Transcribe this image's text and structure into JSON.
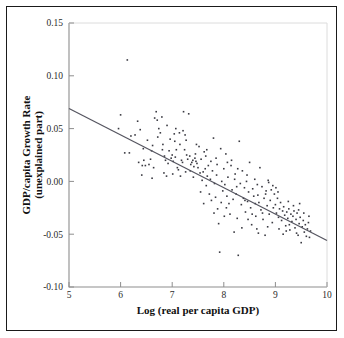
{
  "figure": {
    "border_color": "#1a1a1a",
    "background": "#ffffff"
  },
  "chart_data": {
    "type": "scatter",
    "title": "",
    "subtitle": "",
    "xlabel": "Log (real per capita GDP)",
    "ylabel": "GDP/capita Growth Rate (unexplained part)",
    "ylabel_line1": "GDP/capita Growth Rate",
    "ylabel_line2": "(unexplained part)",
    "xlim": [
      5,
      10
    ],
    "ylim": [
      -0.1,
      0.15
    ],
    "xticks": [
      5,
      6,
      7,
      8,
      9,
      10
    ],
    "xtick_labels": [
      "5",
      "6",
      "7",
      "8",
      "9",
      "10"
    ],
    "yticks": [
      -0.1,
      -0.05,
      0.0,
      0.05,
      0.1,
      0.15
    ],
    "ytick_labels": [
      "-0.10",
      "-0.05",
      "0.00",
      "0.05",
      "0.10",
      "0.15"
    ],
    "grid": false,
    "legend": null,
    "point_color": "#3a3a42",
    "point_size": 1.6,
    "marker": "square",
    "series": [
      {
        "name": "countries",
        "points": [
          [
            6.13,
            0.115
          ],
          [
            6.0,
            0.063
          ],
          [
            6.08,
            0.027
          ],
          [
            6.17,
            0.027
          ],
          [
            5.96,
            0.05
          ],
          [
            6.28,
            0.044
          ],
          [
            6.33,
            0.057
          ],
          [
            6.38,
            0.049
          ],
          [
            6.42,
            0.015
          ],
          [
            6.45,
            0.02
          ],
          [
            6.48,
            0.015
          ],
          [
            6.52,
            0.039
          ],
          [
            6.55,
            0.016
          ],
          [
            6.58,
            0.021
          ],
          [
            6.62,
            0.034
          ],
          [
            6.66,
            0.06
          ],
          [
            6.69,
            0.066
          ],
          [
            6.71,
            0.058
          ],
          [
            6.74,
            0.05
          ],
          [
            6.77,
            0.046
          ],
          [
            6.8,
            0.061
          ],
          [
            6.82,
            0.035
          ],
          [
            6.85,
            0.024
          ],
          [
            6.87,
            0.02
          ],
          [
            6.89,
            0.005
          ],
          [
            6.92,
            0.017
          ],
          [
            6.94,
            0.029
          ],
          [
            6.96,
            0.04
          ],
          [
            6.98,
            0.022
          ],
          [
            7.0,
            0.025
          ],
          [
            7.02,
            0.019
          ],
          [
            7.04,
            0.045
          ],
          [
            7.06,
            0.023
          ],
          [
            7.08,
            0.03
          ],
          [
            7.1,
            0.013
          ],
          [
            7.12,
            0.011
          ],
          [
            7.14,
            0.046
          ],
          [
            7.16,
            0.005
          ],
          [
            7.18,
            0.02
          ],
          [
            7.2,
            0.018
          ],
          [
            7.22,
            0.066
          ],
          [
            7.24,
            0.03
          ],
          [
            7.26,
            0.009
          ],
          [
            7.28,
            0.025
          ],
          [
            7.3,
            0.021
          ],
          [
            7.32,
            0.064
          ],
          [
            7.34,
            0.024
          ],
          [
            7.36,
            0.016
          ],
          [
            7.38,
            0.018
          ],
          [
            7.4,
            0.02
          ],
          [
            7.42,
            0.014
          ],
          [
            7.44,
            0.022
          ],
          [
            7.46,
            0.019
          ],
          [
            7.48,
            0.017
          ],
          [
            7.5,
            0.013
          ],
          [
            7.52,
            0.033
          ],
          [
            7.54,
            0.008
          ],
          [
            7.56,
            0.021
          ],
          [
            7.58,
            0.001
          ],
          [
            7.6,
            0.009
          ],
          [
            7.62,
            0.028
          ],
          [
            7.64,
            0.012
          ],
          [
            7.66,
            -0.004
          ],
          [
            7.68,
            0.005
          ],
          [
            7.7,
            0.015
          ],
          [
            7.72,
            -0.012
          ],
          [
            7.74,
            0.002
          ],
          [
            7.76,
            -0.018
          ],
          [
            7.78,
            0.01
          ],
          [
            7.8,
            0.041
          ],
          [
            7.82,
            -0.002
          ],
          [
            7.84,
            -0.015
          ],
          [
            7.86,
            0.006
          ],
          [
            7.88,
            -0.026
          ],
          [
            7.9,
            -0.04
          ],
          [
            7.92,
            -0.067
          ],
          [
            7.94,
            0.031
          ],
          [
            7.96,
            0.0
          ],
          [
            7.98,
            -0.009
          ],
          [
            8.0,
            0.012
          ],
          [
            8.02,
            -0.003
          ],
          [
            8.04,
            0.026
          ],
          [
            8.06,
            -0.014
          ],
          [
            8.08,
            0.004
          ],
          [
            8.1,
            -0.021
          ],
          [
            8.12,
            -0.031
          ],
          [
            8.14,
            0.015
          ],
          [
            8.16,
            -0.008
          ],
          [
            8.18,
            -0.017
          ],
          [
            8.2,
            -0.048
          ],
          [
            8.22,
            0.007
          ],
          [
            8.24,
            -0.012
          ],
          [
            8.26,
            -0.035
          ],
          [
            8.28,
            -0.07
          ],
          [
            8.3,
            0.038
          ],
          [
            8.32,
            -0.002
          ],
          [
            8.34,
            -0.022
          ],
          [
            8.36,
            0.01
          ],
          [
            8.38,
            -0.016
          ],
          [
            8.4,
            -0.006
          ],
          [
            8.42,
            -0.029
          ],
          [
            8.44,
            0.0
          ],
          [
            8.46,
            -0.019
          ],
          [
            8.48,
            -0.01
          ],
          [
            8.5,
            0.018
          ],
          [
            8.52,
            -0.025
          ],
          [
            8.54,
            -0.041
          ],
          [
            8.56,
            -0.007
          ],
          [
            8.58,
            -0.014
          ],
          [
            8.6,
            0.002
          ],
          [
            8.62,
            -0.033
          ],
          [
            8.64,
            -0.045
          ],
          [
            8.66,
            -0.013
          ],
          [
            8.68,
            -0.02
          ],
          [
            8.7,
            0.013
          ],
          [
            8.72,
            -0.027
          ],
          [
            8.74,
            -0.005
          ],
          [
            8.76,
            -0.036
          ],
          [
            8.78,
            -0.016
          ],
          [
            8.8,
            -0.051
          ],
          [
            8.82,
            -0.009
          ],
          [
            8.84,
            -0.023
          ],
          [
            8.86,
            0.001
          ],
          [
            8.88,
            -0.031
          ],
          [
            8.9,
            -0.018
          ],
          [
            8.92,
            -0.008
          ],
          [
            8.94,
            -0.039
          ],
          [
            8.96,
            -0.025
          ],
          [
            8.98,
            -0.012
          ],
          [
            9.0,
            -0.022
          ],
          [
            9.02,
            -0.03
          ],
          [
            9.04,
            -0.016
          ],
          [
            9.06,
            -0.034
          ],
          [
            9.08,
            -0.026
          ],
          [
            9.1,
            -0.02
          ],
          [
            9.12,
            -0.037
          ],
          [
            9.14,
            -0.028
          ],
          [
            9.16,
            -0.024
          ],
          [
            9.18,
            -0.032
          ],
          [
            9.2,
            -0.042
          ],
          [
            9.22,
            -0.029
          ],
          [
            9.24,
            -0.035
          ],
          [
            9.26,
            -0.026
          ],
          [
            9.28,
            -0.046
          ],
          [
            9.3,
            -0.031
          ],
          [
            9.32,
            -0.038
          ],
          [
            9.34,
            -0.033
          ],
          [
            9.36,
            -0.028
          ],
          [
            9.38,
            -0.044
          ],
          [
            9.4,
            -0.036
          ],
          [
            9.42,
            -0.03
          ],
          [
            9.44,
            -0.051
          ],
          [
            9.46,
            -0.04
          ],
          [
            9.48,
            -0.034
          ],
          [
            9.5,
            -0.058
          ],
          [
            9.52,
            -0.043
          ],
          [
            9.54,
            -0.037
          ],
          [
            9.56,
            -0.048
          ],
          [
            9.58,
            -0.041
          ],
          [
            9.6,
            -0.052
          ],
          [
            9.62,
            -0.045
          ],
          [
            9.64,
            -0.039
          ],
          [
            9.66,
            -0.053
          ],
          [
            9.68,
            -0.047
          ],
          [
            6.2,
            0.043
          ],
          [
            6.35,
            0.018
          ],
          [
            6.6,
            0.029
          ],
          [
            6.72,
            0.042
          ],
          [
            6.9,
            0.053
          ],
          [
            7.05,
            0.038
          ],
          [
            7.15,
            0.035
          ],
          [
            7.25,
            0.044
          ],
          [
            7.35,
            0.01
          ],
          [
            7.45,
            0.026
          ],
          [
            7.55,
            -0.01
          ],
          [
            7.65,
            0.024
          ],
          [
            7.75,
            0.019
          ],
          [
            7.85,
            0.022
          ],
          [
            7.95,
            -0.02
          ],
          [
            8.05,
            -0.025
          ],
          [
            8.15,
            0.02
          ],
          [
            8.25,
            -0.005
          ],
          [
            8.35,
            -0.044
          ],
          [
            8.45,
            0.006
          ],
          [
            8.55,
            -0.031
          ],
          [
            8.65,
            -0.003
          ],
          [
            8.75,
            -0.03
          ],
          [
            8.85,
            -0.043
          ],
          [
            8.95,
            -0.004
          ],
          [
            9.05,
            -0.01
          ],
          [
            9.15,
            -0.05
          ],
          [
            9.25,
            -0.019
          ],
          [
            9.35,
            -0.023
          ],
          [
            9.45,
            -0.027
          ],
          [
            9.55,
            -0.03
          ],
          [
            9.65,
            -0.033
          ],
          [
            6.44,
            0.031
          ],
          [
            6.64,
            0.013
          ],
          [
            6.84,
            0.008
          ],
          [
            7.07,
            0.05
          ],
          [
            7.27,
            0.039
          ],
          [
            7.47,
            0.035
          ],
          [
            7.67,
            0.03
          ],
          [
            7.87,
            0.016
          ],
          [
            8.07,
            0.018
          ],
          [
            8.27,
            0.012
          ],
          [
            8.47,
            -0.036
          ],
          [
            8.67,
            -0.049
          ],
          [
            8.87,
            -0.001
          ],
          [
            9.07,
            -0.045
          ],
          [
            9.27,
            -0.041
          ],
          [
            9.47,
            -0.021
          ],
          [
            6.41,
            0.006
          ],
          [
            6.61,
            0.003
          ],
          [
            6.81,
            0.03
          ],
          [
            7.01,
            0.007
          ],
          [
            7.21,
            0.048
          ],
          [
            7.41,
            0.004
          ],
          [
            7.61,
            -0.021
          ],
          [
            7.81,
            -0.03
          ],
          [
            8.01,
            -0.033
          ],
          [
            8.21,
            0.002
          ],
          [
            8.41,
            -0.018
          ],
          [
            8.61,
            -0.021
          ],
          [
            8.81,
            -0.012
          ],
          [
            9.01,
            -0.006
          ],
          [
            9.21,
            -0.047
          ],
          [
            9.41,
            -0.049
          ]
        ]
      }
    ],
    "fit_line": {
      "name": "regression-line",
      "color": "#555560",
      "x_start": 5.0,
      "y_start": 0.069,
      "x_end": 10.0,
      "y_end": -0.056,
      "slope": -0.025,
      "intercept": 0.194
    }
  }
}
